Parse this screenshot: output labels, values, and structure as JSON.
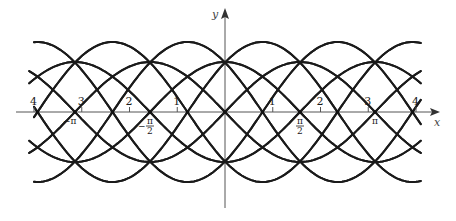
{
  "figure": {
    "type": "function-family-plot",
    "axes": {
      "x_label": "x",
      "y_label": "y",
      "origin_px": [
        225,
        112
      ],
      "unit_px": 47.75
    },
    "integer_ticks": [
      {
        "value": -4,
        "label": "4"
      },
      {
        "value": -3,
        "label": "3"
      },
      {
        "value": -2,
        "label": "2"
      },
      {
        "value": -1,
        "label": "1"
      },
      {
        "value": 1,
        "label": "1"
      },
      {
        "value": 2,
        "label": "2"
      },
      {
        "value": 3,
        "label": "3"
      },
      {
        "value": 4,
        "label": "4"
      }
    ],
    "pi_ticks": [
      {
        "value": -3.14159,
        "label": "−π",
        "kind": "pi"
      },
      {
        "value": -1.5708,
        "label": "−π/2",
        "kind": "half",
        "sign": "−",
        "num": "π",
        "den": "2"
      },
      {
        "value": 1.5708,
        "label": "π/2",
        "kind": "half",
        "sign": "",
        "num": "π",
        "den": "2"
      },
      {
        "value": 3.14159,
        "label": "π",
        "kind": "pi"
      }
    ],
    "curve_families": [
      {
        "name": "outer",
        "amplitude_px": 70,
        "phase_offsets_deg": [
          45,
          135,
          225,
          315
        ],
        "x_range": [
          -4.0,
          4.1
        ]
      },
      {
        "name": "inner",
        "amplitude_px": 50,
        "phase_offsets_deg": [
          0,
          90,
          180,
          270
        ],
        "x_range": [
          -4.1,
          4.1
        ]
      }
    ],
    "colors": {
      "curve": "#1a1a1a",
      "axis": "#555555",
      "background": "#ffffff"
    }
  }
}
